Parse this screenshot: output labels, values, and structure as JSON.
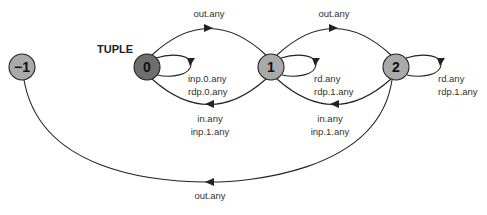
{
  "diagram": {
    "title": "TUPLE",
    "colors": {
      "node_fill": "#a9a9a9",
      "start_node_fill": "#6e6e6e",
      "stroke": "#222222",
      "text": "#333333"
    },
    "nodes": [
      {
        "id": "-1",
        "label": "−1"
      },
      {
        "id": "0",
        "label": "0",
        "initial": true
      },
      {
        "id": "1",
        "label": "1"
      },
      {
        "id": "2",
        "label": "2"
      }
    ],
    "edges": [
      {
        "from": "0",
        "to": "1",
        "label": "out.any"
      },
      {
        "from": "1",
        "to": "2",
        "label": "out.any"
      },
      {
        "from": "1",
        "to": "0",
        "label_lines": [
          "in.any",
          "inp.1.any"
        ]
      },
      {
        "from": "2",
        "to": "1",
        "label_lines": [
          "in.any",
          "inp.1.any"
        ]
      },
      {
        "from": "0",
        "to": "0",
        "label_lines": [
          "inp.0.any",
          "rdp.0.any"
        ]
      },
      {
        "from": "1",
        "to": "1",
        "label_lines": [
          "rd.any",
          "rdp.1.any"
        ]
      },
      {
        "from": "2",
        "to": "2",
        "label_lines": [
          "rd.any",
          "rdp.1.any"
        ]
      },
      {
        "from": "2",
        "to": "-1",
        "label": "out.any"
      }
    ]
  }
}
